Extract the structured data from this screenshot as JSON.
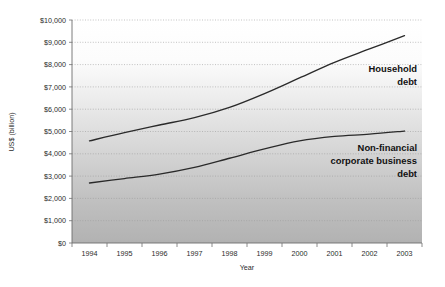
{
  "chart_data": {
    "type": "line",
    "title": "",
    "xlabel": "Year",
    "ylabel": "US$ (billion)",
    "categories": [
      "1994",
      "1995",
      "1996",
      "1997",
      "1998",
      "1999",
      "2000",
      "2001",
      "2002",
      "2003"
    ],
    "ylim": [
      0,
      10000
    ],
    "ytick_values": [
      0,
      1000,
      2000,
      3000,
      4000,
      5000,
      6000,
      7000,
      8000,
      9000,
      10000
    ],
    "ytick_labels": [
      "$0",
      "$1,000",
      "$2,000",
      "$3,000",
      "$4,000",
      "$5,000",
      "$6,000",
      "$7,000",
      "$8,000",
      "$9,000",
      "$10,000"
    ],
    "grid": true,
    "legend_position": "inline-annotation",
    "series": [
      {
        "name": "Household debt",
        "label_lines": [
          "Household",
          "debt"
        ],
        "color": "#2a2a2a",
        "values": [
          4580,
          4950,
          5290,
          5620,
          6080,
          6700,
          7400,
          8100,
          8700,
          9300
        ]
      },
      {
        "name": "Non-financial corporate business debt",
        "label_lines": [
          "Non-financial",
          "corporate business",
          "debt"
        ],
        "color": "#2a2a2a",
        "values": [
          2690,
          2890,
          3090,
          3390,
          3800,
          4220,
          4580,
          4780,
          4880,
          5020
        ]
      }
    ],
    "annotations": [
      {
        "text": "Household debt",
        "series": "Household debt"
      },
      {
        "text": "Non-financial corporate business debt",
        "series": "Non-financial corporate business debt"
      }
    ],
    "background": {
      "plot_gradient_top": "#ffffff",
      "plot_gradient_bottom": "#b2b2b2",
      "page": "#ffffff"
    }
  }
}
